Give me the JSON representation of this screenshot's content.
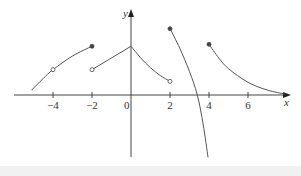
{
  "chart_data": {
    "type": "line",
    "title": "",
    "xlabel": "x",
    "ylabel": "y",
    "xlim": [
      -6.2,
      8.2
    ],
    "ylim": [
      -3.2,
      4.4
    ],
    "grid": false,
    "x_ticks": [
      -4,
      -2,
      0,
      2,
      4,
      6
    ],
    "x_tick_labels": [
      "−4",
      "−2",
      "0",
      "2",
      "4",
      "6"
    ],
    "series": [
      {
        "name": "piece-1",
        "x": [
          -5.1,
          -4.5,
          -4,
          -3,
          -2
        ],
        "y": [
          0.25,
          0.85,
          1.3,
          2.0,
          2.5
        ],
        "endpoints": [
          {
            "x": -4,
            "y": 1.3,
            "kind": "open"
          },
          {
            "x": -2,
            "y": 2.5,
            "kind": "closed"
          }
        ]
      },
      {
        "name": "piece-2",
        "x": [
          -2,
          0
        ],
        "y": [
          1.3,
          2.5
        ],
        "endpoints": [
          {
            "x": -2,
            "y": 1.3,
            "kind": "open"
          }
        ]
      },
      {
        "name": "piece-3",
        "x": [
          0,
          0.5,
          1,
          1.5,
          2
        ],
        "y": [
          2.5,
          1.9,
          1.4,
          1.0,
          0.7
        ],
        "endpoints": [
          {
            "x": 2,
            "y": 0.7,
            "kind": "open"
          }
        ]
      },
      {
        "name": "piece-4",
        "x": [
          2,
          2.5,
          3,
          3.4,
          3.7,
          3.95
        ],
        "y": [
          3.4,
          2.4,
          1.2,
          0.0,
          -1.5,
          -3.2
        ],
        "endpoints": [
          {
            "x": 2,
            "y": 3.4,
            "kind": "closed"
          }
        ]
      },
      {
        "name": "piece-5",
        "x": [
          4,
          4.5,
          5,
          6,
          7,
          7.9
        ],
        "y": [
          2.6,
          1.9,
          1.35,
          0.65,
          0.25,
          0.05
        ],
        "endpoints": [
          {
            "x": 4,
            "y": 2.6,
            "kind": "closed"
          }
        ]
      }
    ]
  },
  "axes": {
    "x_label": "x",
    "y_label": "y",
    "ticks": [
      "−4",
      "−2",
      "0",
      "2",
      "4",
      "6"
    ]
  }
}
